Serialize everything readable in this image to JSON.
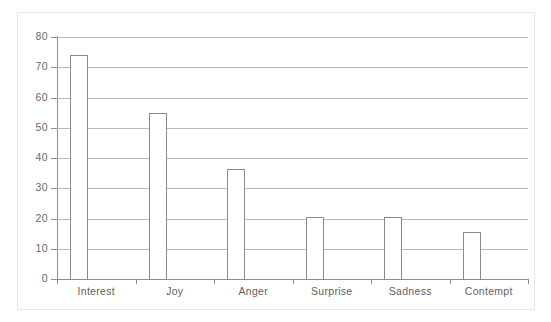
{
  "chart_data": {
    "type": "bar",
    "title": "",
    "subtitle": "",
    "xlabel": "",
    "ylabel": "",
    "categories": [
      "Interest",
      "Joy",
      "Anger",
      "Surprise",
      "Sadness",
      "Contempt"
    ],
    "values": [
      74,
      55,
      36.5,
      20.5,
      20.5,
      15.5
    ],
    "series": [
      {
        "name": "",
        "values": [
          74,
          55,
          36.5,
          20.5,
          20.5,
          15.5
        ]
      }
    ],
    "ylim": [
      0,
      80
    ],
    "ytick_labels": [
      "0",
      "10",
      "20",
      "30",
      "40",
      "50",
      "60",
      "70",
      "80"
    ],
    "ytick_values": [
      0,
      10,
      20,
      30,
      40,
      50,
      60,
      70,
      80
    ],
    "grid": "horizontal",
    "legend": "none",
    "annotations": [],
    "colors": {
      "bar_fill": "#ffffff",
      "bar_stroke": "#8a8a8a",
      "gridline": "#b9b9b9",
      "axis": "#8e8e8e",
      "tick_label": "#6a6a6a",
      "category_label": "#5f5f5f",
      "background": "#ffffff",
      "frame": "#e7e7e7"
    }
  }
}
